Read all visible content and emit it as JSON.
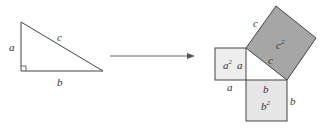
{
  "diagram": {
    "triangle": {
      "labels": {
        "vertical_leg": "a",
        "horizontal_leg": "b",
        "hypotenuse": "c"
      },
      "right_angle_marker": true
    },
    "arrow": {
      "direction": "right"
    },
    "squares": {
      "a_square": {
        "label": "a",
        "exponent": "2",
        "side_labels": [
          "a",
          "a"
        ],
        "fill": "#eeeeee"
      },
      "b_square": {
        "label": "b",
        "exponent": "2",
        "side_labels": [
          "b",
          "b"
        ],
        "fill": "#e6e6e6"
      },
      "c_square": {
        "label": "c",
        "exponent": "2",
        "side_labels": [
          "c",
          "c"
        ],
        "fill": "#a6a6a6"
      }
    },
    "colors": {
      "stroke": "#444444",
      "c_fill": "#a6a6a6",
      "a_fill": "#eeeeee",
      "b_fill": "#e6e6e6"
    }
  }
}
